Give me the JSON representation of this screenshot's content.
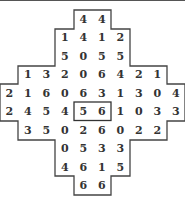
{
  "puzzle": {
    "rows": [
      {
        "start": 4,
        "digits": [
          "4",
          "4"
        ]
      },
      {
        "start": 3,
        "digits": [
          "1",
          "4",
          "1",
          "2"
        ]
      },
      {
        "start": 3,
        "digits": [
          "5",
          "0",
          "5",
          "5"
        ]
      },
      {
        "start": 1,
        "digits": [
          "1",
          "3",
          "2",
          "0",
          "6",
          "4",
          "2",
          "1"
        ]
      },
      {
        "start": 0,
        "digits": [
          "2",
          "1",
          "6",
          "0",
          "6",
          "3",
          "1",
          "3",
          "0",
          "4"
        ]
      },
      {
        "start": 0,
        "digits": [
          "2",
          "4",
          "5",
          "4",
          "5",
          "6",
          "1",
          "0",
          "3",
          "3"
        ]
      },
      {
        "start": 1,
        "digits": [
          "3",
          "5",
          "0",
          "2",
          "6",
          "0",
          "2",
          "2"
        ]
      },
      {
        "start": 3,
        "digits": [
          "0",
          "5",
          "3",
          "3"
        ]
      },
      {
        "start": 3,
        "digits": [
          "4",
          "6",
          "1",
          "5"
        ]
      },
      {
        "start": 4,
        "digits": [
          "6",
          "6"
        ]
      }
    ],
    "highlight": {
      "row": 5,
      "col": 4,
      "span": 2
    }
  }
}
